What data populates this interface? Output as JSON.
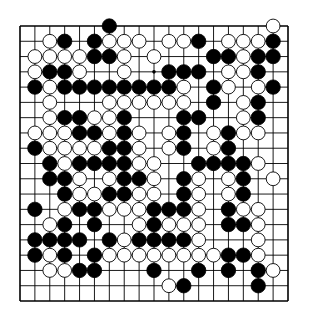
{
  "diagram": {
    "type": "go-board",
    "size": 19,
    "colors": {
      "line": "#000000",
      "black_stone": "#000000",
      "white_stone": "#ffffff",
      "background": "#ffffff"
    },
    "geometry": {
      "left": 20,
      "top": 26,
      "right": 288,
      "bottom": 301,
      "stone_radius": 7.2
    },
    "star_points": [
      [
        3,
        9
      ]
    ],
    "rows": [
      "......B..........W.",
      "..WB.BWWW.WWB.WWWB.",
      ".WWWWBBW.W...BBWBB.",
      ".WBBW..W..BBB.WWB..",
      ".BWBBBBBBBBW.BW.WB.",
      "..W...WWWWWW.B.WB..",
      "..WBBWWB...BB..WB..",
      ".WWWBBWBW.WB.WBWW..",
      ".BWWWWBBW.WB.WB....",
      "..BWBBBBWW..BBBBW..",
      "..BBW.WBBW.BW.WB.W.",
      "...BWWBBWW.BW.WB...",
      ".B.WBBWWWBBBW.BWW..",
      "..WB.B..WBWWW.BBW..",
      ".BBBB.BWBBBBW...W..",
      ".BWB.BWWWWWWWWBBW..",
      "..WWBB...B..B.B.BW.",
      "..........WB....B..",
      "..................."
    ]
  }
}
